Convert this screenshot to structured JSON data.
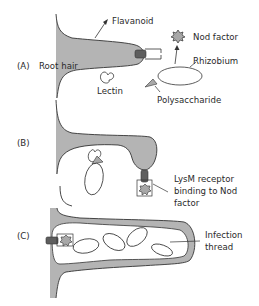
{
  "diagram": {
    "colors": {
      "cell_fill": "#b4b4b4",
      "receptor_fill": "#5e5e5e",
      "nod_fill": "#a8a8a8",
      "stroke": "#333333",
      "background": "#ffffff"
    },
    "panels": [
      {
        "id": "A",
        "label": "(A)",
        "annotations": {
          "root_hair": "Root hair",
          "flavanoid": "Flavanoid",
          "nod_factor": "Nod factor",
          "rhizobium": "Rhizobium",
          "lectin": "Lectin",
          "polysaccharide": "Polysaccharide"
        }
      },
      {
        "id": "B",
        "label": "(B)",
        "annotations": {
          "lysm_line1": "LysM receptor",
          "lysm_line2": "binding to Nod",
          "lysm_line3": "factor"
        }
      },
      {
        "id": "C",
        "label": "(C)",
        "annotations": {
          "infection_line1": "Infection",
          "infection_line2": "thread"
        }
      }
    ]
  }
}
